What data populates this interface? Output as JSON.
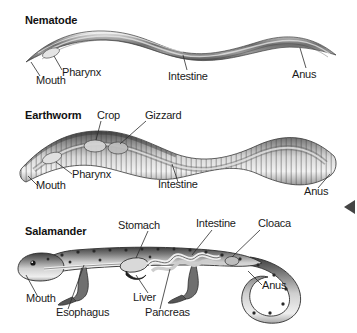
{
  "figure": {
    "background_color": "#ffffff",
    "text_color": "#1a1a1a",
    "title_color": "#111111",
    "leader_line_color": "#2b2b2b"
  },
  "panels": [
    {
      "id": "nematode",
      "title": "Nematode",
      "labels": [
        {
          "name": "mouth",
          "text": "Mouth"
        },
        {
          "name": "pharynx",
          "text": "Pharynx"
        },
        {
          "name": "intestine",
          "text": "Intestine"
        },
        {
          "name": "anus",
          "text": "Anus"
        }
      ]
    },
    {
      "id": "earthworm",
      "title": "Earthworm",
      "labels": [
        {
          "name": "crop",
          "text": "Crop"
        },
        {
          "name": "gizzard",
          "text": "Gizzard"
        },
        {
          "name": "pharynx",
          "text": "Pharynx"
        },
        {
          "name": "mouth",
          "text": "Mouth"
        },
        {
          "name": "intestine",
          "text": "Intestine"
        },
        {
          "name": "anus",
          "text": "Anus"
        }
      ]
    },
    {
      "id": "salamander",
      "title": "Salamander",
      "labels": [
        {
          "name": "stomach",
          "text": "Stomach"
        },
        {
          "name": "intestine",
          "text": "Intestine"
        },
        {
          "name": "cloaca",
          "text": "Cloaca"
        },
        {
          "name": "anus",
          "text": "Anus"
        },
        {
          "name": "mouth",
          "text": "Mouth"
        },
        {
          "name": "liver",
          "text": "Liver"
        },
        {
          "name": "esophagus",
          "text": "Esophagus"
        },
        {
          "name": "pancreas",
          "text": "Pancreas"
        }
      ]
    }
  ]
}
